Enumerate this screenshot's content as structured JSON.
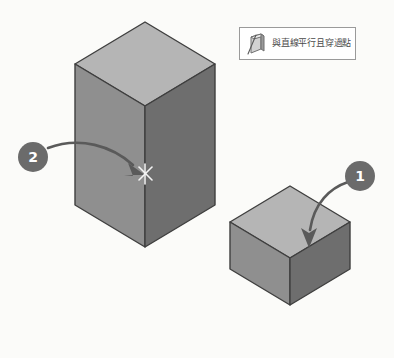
{
  "canvas": {
    "width": 394,
    "height": 358,
    "background_color": "#fbfbf9"
  },
  "tooltip": {
    "label": "與直線平行且穿過點",
    "icon_name": "parallel-plane-prism-icon",
    "background_color": "#ffffff",
    "border_color": "#9a9a9a",
    "text_color": "#4a4a4a"
  },
  "badges": [
    {
      "label": "1",
      "name": "badge-1",
      "color": "#6b6b6b",
      "text_color": "#ffffff"
    },
    {
      "label": "2",
      "name": "badge-2",
      "color": "#6b6b6b",
      "text_color": "#ffffff"
    }
  ],
  "shapes": {
    "tall_box": {
      "name": "tall-rectangular-prism",
      "top_face_color": "#b5b5b5",
      "left_face_color": "#8f8f8f",
      "right_face_color": "#6e6e6e",
      "outline_color": "#3f3f3f"
    },
    "small_cube": {
      "name": "small-cube",
      "top_face_color": "#b5b5b5",
      "left_face_color": "#8f8f8f",
      "right_face_color": "#6e6e6e",
      "outline_color": "#3f3f3f"
    }
  },
  "annotations": {
    "arrow_color": "#5a5a5a",
    "marker_color": "#f2f2f2",
    "marker_name": "point-snap-x-marker"
  }
}
